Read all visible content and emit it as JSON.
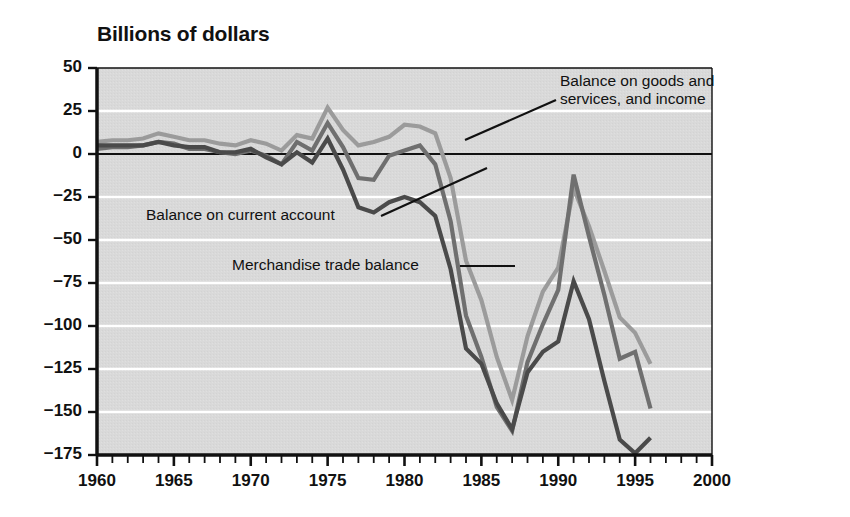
{
  "chart_data": {
    "type": "line",
    "title": "Billions of dollars",
    "xlabel": "",
    "ylabel": "Billions of dollars",
    "xlim": [
      1960,
      2000
    ],
    "ylim": [
      -175,
      50
    ],
    "yticks": [
      50,
      25,
      0,
      -25,
      -50,
      -75,
      -100,
      -125,
      -150,
      -175
    ],
    "ytick_labels": [
      "50",
      "25",
      "0",
      "−25",
      "−50",
      "−75",
      "−100",
      "−125",
      "−150",
      "−175"
    ],
    "xticks": [
      1960,
      1965,
      1970,
      1975,
      1980,
      1985,
      1990,
      1995,
      2000
    ],
    "xtick_labels": [
      "1960",
      "1965",
      "1970",
      "1975",
      "1980",
      "1985",
      "1990",
      "1995",
      "2000"
    ],
    "minor_xtick_interval": 1,
    "grid": "horizontal-white-gridlines",
    "plot_background": "#d9d9d9",
    "legend": "inline-annotations",
    "zero_line": true,
    "x": [
      1960,
      1961,
      1962,
      1963,
      1964,
      1965,
      1966,
      1967,
      1968,
      1969,
      1970,
      1971,
      1972,
      1973,
      1974,
      1975,
      1976,
      1977,
      1978,
      1979,
      1980,
      1981,
      1982,
      1983,
      1984,
      1985,
      1986,
      1987,
      1988,
      1989,
      1990,
      1991,
      1992,
      1993,
      1994,
      1995,
      1996
    ],
    "series": [
      {
        "name": "Balance on goods and services, and income",
        "color": "#9b9b9b",
        "values": [
          7,
          8,
          8,
          9,
          12,
          10,
          8,
          8,
          6,
          5,
          8,
          6,
          2,
          11,
          9,
          27,
          14,
          5,
          7,
          10,
          17,
          16,
          12,
          -14,
          -62,
          -85,
          -118,
          -143,
          -106,
          -80,
          -66,
          -20,
          -42,
          -68,
          -95,
          -104,
          -122
        ]
      },
      {
        "name": "Balance on current account",
        "color": "#6f6f6f",
        "values": [
          3,
          4,
          4,
          5,
          7,
          6,
          3,
          3,
          1,
          0,
          2,
          -1,
          -6,
          7,
          2,
          18,
          4,
          -14,
          -15,
          -1,
          2,
          5,
          -6,
          -39,
          -94,
          -118,
          -147,
          -161,
          -121,
          -99,
          -79,
          -12,
          -48,
          -82,
          -119,
          -115,
          -148
        ]
      },
      {
        "name": "Merchandise trade balance",
        "color": "#4a4a4a",
        "values": [
          5,
          5,
          5,
          5,
          7,
          5,
          4,
          4,
          1,
          1,
          3,
          -2,
          -6,
          1,
          -5,
          9,
          -9,
          -31,
          -34,
          -28,
          -25,
          -28,
          -36,
          -67,
          -113,
          -122,
          -145,
          -160,
          -127,
          -115,
          -109,
          -74,
          -96,
          -132,
          -166,
          -174,
          -165
        ]
      }
    ],
    "annotations": [
      {
        "name": "balance-goods-services-income",
        "text": "Balance on goods and\nservices, and income",
        "text_x": 560,
        "text_y": 72,
        "leader_from_x": 556,
        "leader_from_y": 100,
        "leader_to_x": 465,
        "leader_to_y": 140
      },
      {
        "name": "balance-current-account",
        "text": "Balance on current account",
        "text_x": 146,
        "text_y": 206,
        "leader_from_x": 381,
        "leader_from_y": 216,
        "leader_to_x": 487,
        "leader_to_y": 168
      },
      {
        "name": "merchandise-trade-balance",
        "text": "Merchandise trade balance",
        "text_x": 232,
        "text_y": 256,
        "leader_from_x": 460,
        "leader_from_y": 266,
        "leader_to_x": 515,
        "leader_to_y": 266
      }
    ]
  }
}
